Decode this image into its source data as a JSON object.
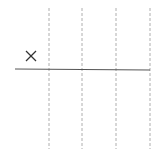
{
  "diagram": {
    "background": "#ffffff",
    "marker": {
      "glyph": "×",
      "x": 31,
      "y": 57,
      "color": "#333333"
    },
    "baseline": {
      "x1": 15,
      "x2": 150,
      "y": 69,
      "color": "#555555"
    },
    "dashed_lines": [
      {
        "x": 49
      },
      {
        "x": 82
      },
      {
        "x": 116
      },
      {
        "x": 150
      }
    ],
    "dashed_color": "#999999"
  }
}
